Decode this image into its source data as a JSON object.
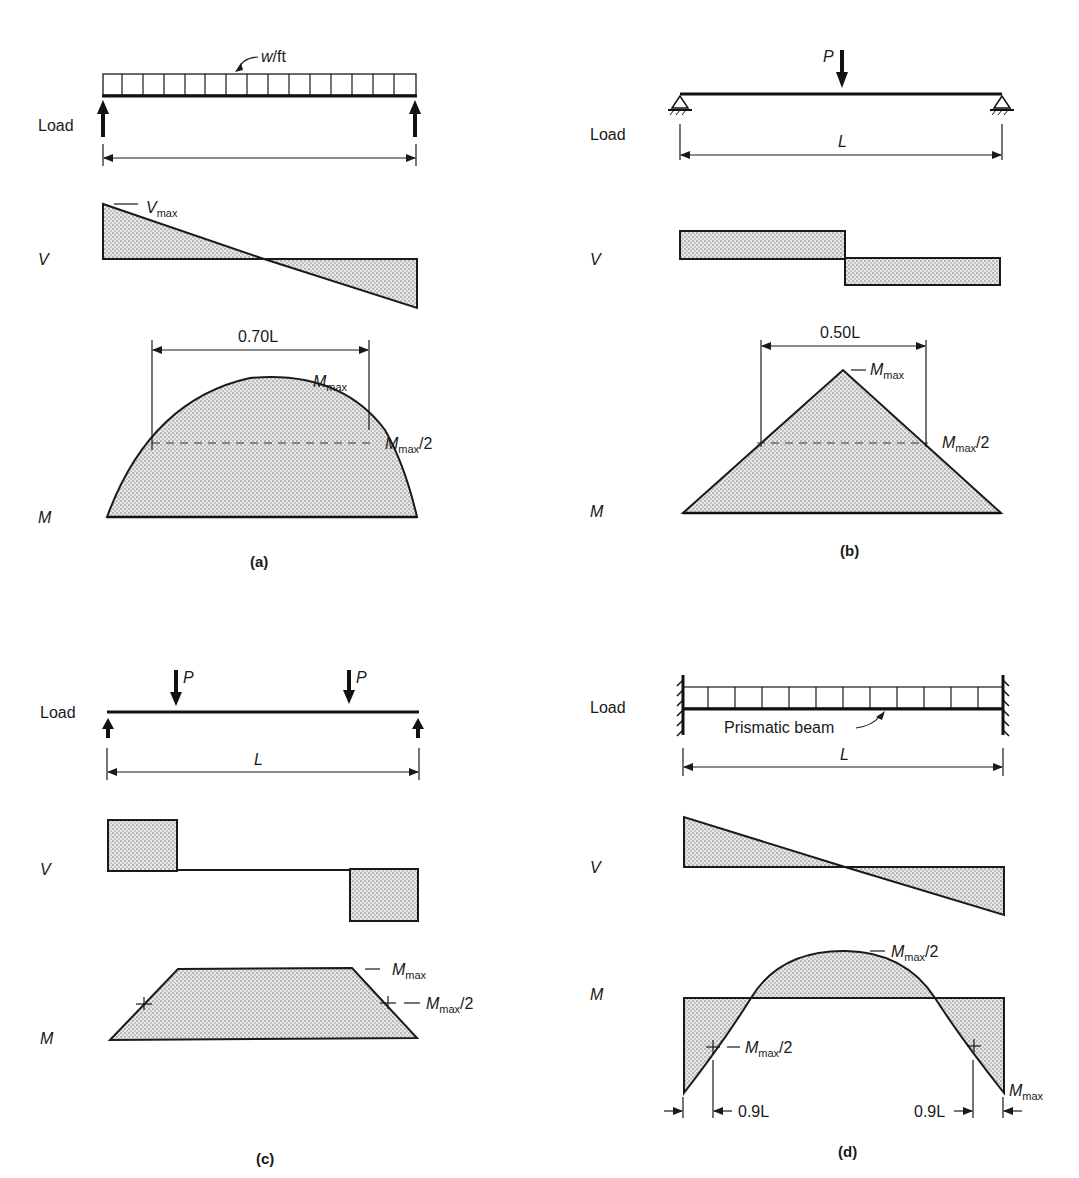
{
  "figure": {
    "panels": [
      {
        "id": "a",
        "caption": "(a)",
        "row_labels": {
          "load": "Load",
          "shear": "V",
          "moment": "M"
        },
        "load_annotation": "w/ft",
        "v_annotation": {
          "main": "V",
          "sub": "max"
        },
        "m_span_label": "0.70L",
        "m_peak_label": {
          "main": "M",
          "sub": "max"
        },
        "m_half_label": {
          "main": "M",
          "sub": "max",
          "suffix": "/2"
        }
      },
      {
        "id": "b",
        "caption": "(b)",
        "row_labels": {
          "load": "Load",
          "shear": "V",
          "moment": "M"
        },
        "point_load": "P",
        "span_label": "L",
        "m_span_label": "0.50L",
        "m_peak_label": {
          "main": "M",
          "sub": "max"
        },
        "m_half_label": {
          "main": "M",
          "sub": "max",
          "suffix": "/2"
        }
      },
      {
        "id": "c",
        "caption": "(c)",
        "row_labels": {
          "load": "Load",
          "shear": "V",
          "moment": "M"
        },
        "point_loads": [
          "P",
          "P"
        ],
        "span_label": "L",
        "m_peak_label": {
          "main": "M",
          "sub": "max"
        },
        "m_half_label": {
          "main": "M",
          "sub": "max",
          "suffix": "/2"
        }
      },
      {
        "id": "d",
        "caption": "(d)",
        "row_labels": {
          "load": "Load",
          "shear": "V",
          "moment": "M"
        },
        "beam_annotation": "Prismatic beam",
        "span_label": "L",
        "m_peak_label": {
          "main": "M",
          "sub": "max",
          "suffix": "/2"
        },
        "m_inner_half_label": {
          "main": "M",
          "sub": "max",
          "suffix": "/2"
        },
        "m_end_label": {
          "main": "M",
          "sub": "max"
        },
        "left_dim_label": "0.9L",
        "right_dim_label": "0.9L"
      }
    ]
  }
}
